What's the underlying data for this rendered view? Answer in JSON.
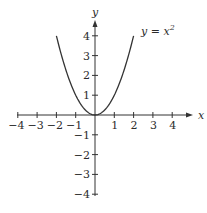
{
  "chart_data": {
    "type": "line",
    "title": "",
    "xlabel": "x",
    "ylabel": "y",
    "xlim": [
      -4,
      4
    ],
    "ylim": [
      -4,
      4
    ],
    "grid": false,
    "x_ticks": [
      -4,
      -3,
      -2,
      -1,
      1,
      2,
      3,
      4
    ],
    "y_ticks": [
      -4,
      -3,
      -2,
      -1,
      1,
      2,
      3,
      4
    ],
    "x_tick_labels": [
      "−4",
      "−3",
      "−2",
      "−1",
      "1",
      "2",
      "3",
      "4"
    ],
    "y_tick_labels": [
      "4",
      "3",
      "2",
      "1",
      "−1",
      "−2",
      "−3",
      "−4"
    ],
    "series": [
      {
        "name": "y = x^2",
        "function": "x^2",
        "x": [
          -2,
          -1.5,
          -1,
          -0.5,
          0,
          0.5,
          1,
          1.5,
          2
        ],
        "y": [
          4,
          2.25,
          1,
          0.25,
          0,
          0.25,
          1,
          2.25,
          4
        ]
      }
    ],
    "annotations": [
      {
        "text_base": "y = x",
        "superscript": "2"
      }
    ],
    "line_color": "#333333"
  }
}
